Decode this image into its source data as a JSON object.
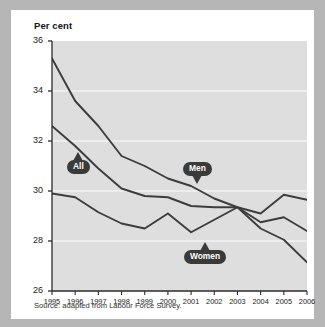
{
  "card": {
    "axis_title": "Per cent",
    "source_note": "Source: adapted from Labour Force Survey."
  },
  "colors": {
    "page_background": "#b6b6b6",
    "card_background": "#ffffff",
    "plot_background": "#dedede",
    "gridline": "#f2f2f2",
    "axis": "#2b2b2b",
    "line": "#3c3c3c",
    "callout_fill": "#3a3a3a",
    "callout_text": "#ffffff"
  },
  "callouts": [
    {
      "name": "All",
      "label": "All",
      "direction": "up"
    },
    {
      "name": "Men",
      "label": "Men",
      "direction": "down"
    },
    {
      "name": "Women",
      "label": "Women",
      "direction": "up"
    }
  ],
  "chart_data": {
    "type": "line",
    "title": "",
    "subtitle": "",
    "xlabel": "",
    "ylabel": "Per cent",
    "ylim": [
      26,
      36
    ],
    "xlim": [
      1995,
      2006
    ],
    "yticks": [
      26,
      28,
      30,
      32,
      34,
      36
    ],
    "grid": true,
    "grid_axis": "y",
    "legend": "inline-callouts",
    "legend_position": "inline",
    "x": [
      1995,
      1996,
      1997,
      1998,
      1999,
      2000,
      2001,
      2002,
      2003,
      2004,
      2005,
      2006
    ],
    "categories": [
      "1995",
      "1996",
      "1997",
      "1998",
      "1999",
      "2000",
      "2001",
      "2002",
      "2003",
      "2004",
      "2005",
      "2006"
    ],
    "series": [
      {
        "name": "Men",
        "values": [
          35.3,
          33.6,
          32.6,
          31.4,
          31.0,
          30.5,
          30.2,
          29.7,
          29.35,
          29.1,
          29.85,
          29.65
        ]
      },
      {
        "name": "All",
        "values": [
          32.6,
          31.8,
          30.9,
          30.1,
          29.8,
          29.75,
          29.4,
          29.35,
          29.35,
          28.75,
          28.95,
          28.4
        ]
      },
      {
        "name": "Women",
        "values": [
          29.9,
          29.75,
          29.15,
          28.7,
          28.5,
          29.1,
          28.35,
          28.85,
          29.35,
          28.5,
          28.05,
          27.15
        ]
      }
    ]
  }
}
